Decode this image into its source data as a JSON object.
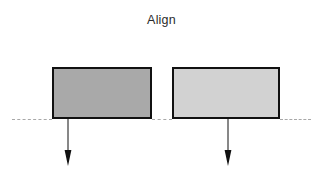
{
  "diagram": {
    "title": "Align",
    "canvas": {
      "width": 323,
      "height": 182,
      "background": "#ffffff"
    },
    "baseline": {
      "name": "alignment-baseline",
      "style": "dashed",
      "color": "#9a9a9a",
      "y": 119
    },
    "shapes": [
      {
        "id": "left",
        "label": "",
        "fill": "#a9a9a9",
        "stroke": "#111111",
        "x": 52,
        "y": 67,
        "width": 100,
        "height": 52
      },
      {
        "id": "right",
        "label": "",
        "fill": "#d2d2d2",
        "stroke": "#111111",
        "x": 172,
        "y": 67,
        "width": 108,
        "height": 52
      }
    ],
    "arrows": [
      {
        "id": "left",
        "direction": "down",
        "x": 68,
        "y_start": 119,
        "y_end": 166,
        "color": "#111111"
      },
      {
        "id": "right",
        "direction": "down",
        "x": 228,
        "y_start": 119,
        "y_end": 166,
        "color": "#111111"
      }
    ]
  }
}
